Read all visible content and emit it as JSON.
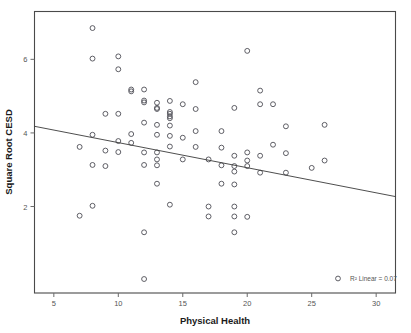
{
  "chart_data": {
    "type": "scatter",
    "title": "",
    "xlabel": "Physical Health",
    "ylabel": "Square Root CESD",
    "xlim": [
      3.5,
      31.5
    ],
    "ylim": [
      -0.35,
      7.3
    ],
    "xticks": [
      5,
      10,
      15,
      20,
      25,
      30
    ],
    "xtick_labels": [
      "5",
      "10",
      "15",
      "20",
      "25",
      "30"
    ],
    "yticks": [
      2,
      4,
      6
    ],
    "ytick_labels": [
      "2",
      "4",
      "6"
    ],
    "grid": false,
    "legend_position": "bottom-right",
    "annotation": "R² Linear = 0.07",
    "annotation_marker": "open-circle",
    "fit": {
      "type": "linear",
      "r_squared": 0.07,
      "x_start": 3.5,
      "y_start": 4.18,
      "x_end": 31.5,
      "y_end": 2.27
    },
    "marker": "open-circle",
    "points": [
      [
        8.0,
        6.85
      ],
      [
        8.0,
        6.02
      ],
      [
        10.0,
        6.08
      ],
      [
        10.0,
        5.73
      ],
      [
        20.0,
        6.23
      ],
      [
        16.0,
        5.38
      ],
      [
        11.0,
        5.18
      ],
      [
        11.0,
        5.13
      ],
      [
        12.0,
        5.18
      ],
      [
        21.0,
        5.15
      ],
      [
        12.0,
        4.88
      ],
      [
        12.0,
        4.83
      ],
      [
        13.0,
        4.82
      ],
      [
        14.0,
        4.87
      ],
      [
        15.0,
        4.78
      ],
      [
        21.0,
        4.78
      ],
      [
        22.0,
        4.78
      ],
      [
        13.0,
        4.68
      ],
      [
        13.0,
        4.65
      ],
      [
        16.0,
        4.65
      ],
      [
        19.0,
        4.68
      ],
      [
        9.0,
        4.52
      ],
      [
        10.0,
        4.52
      ],
      [
        14.0,
        4.57
      ],
      [
        14.0,
        4.52
      ],
      [
        14.0,
        4.45
      ],
      [
        14.0,
        4.4
      ],
      [
        12.0,
        4.28
      ],
      [
        13.0,
        4.22
      ],
      [
        14.0,
        4.2
      ],
      [
        23.0,
        4.18
      ],
      [
        26.0,
        4.22
      ],
      [
        16.0,
        4.05
      ],
      [
        18.0,
        4.05
      ],
      [
        8.0,
        3.95
      ],
      [
        11.0,
        3.97
      ],
      [
        13.0,
        3.95
      ],
      [
        14.0,
        3.92
      ],
      [
        15.0,
        3.87
      ],
      [
        10.0,
        3.78
      ],
      [
        11.0,
        3.73
      ],
      [
        22.0,
        3.68
      ],
      [
        7.0,
        3.62
      ],
      [
        14.0,
        3.63
      ],
      [
        16.0,
        3.62
      ],
      [
        18.0,
        3.6
      ],
      [
        9.0,
        3.52
      ],
      [
        10.0,
        3.48
      ],
      [
        12.0,
        3.47
      ],
      [
        13.0,
        3.47
      ],
      [
        20.0,
        3.47
      ],
      [
        23.0,
        3.45
      ],
      [
        19.0,
        3.38
      ],
      [
        21.0,
        3.38
      ],
      [
        13.0,
        3.28
      ],
      [
        15.0,
        3.28
      ],
      [
        17.0,
        3.28
      ],
      [
        20.0,
        3.25
      ],
      [
        26.0,
        3.25
      ],
      [
        8.0,
        3.13
      ],
      [
        9.0,
        3.1
      ],
      [
        12.0,
        3.13
      ],
      [
        13.0,
        3.12
      ],
      [
        18.0,
        3.12
      ],
      [
        19.0,
        3.1
      ],
      [
        20.0,
        3.1
      ],
      [
        25.0,
        3.05
      ],
      [
        19.0,
        2.95
      ],
      [
        21.0,
        2.92
      ],
      [
        23.0,
        2.92
      ],
      [
        13.0,
        2.62
      ],
      [
        18.0,
        2.62
      ],
      [
        19.0,
        2.6
      ],
      [
        14.0,
        2.05
      ],
      [
        8.0,
        2.02
      ],
      [
        17.0,
        2.0
      ],
      [
        19.0,
        2.0
      ],
      [
        7.0,
        1.75
      ],
      [
        17.0,
        1.73
      ],
      [
        19.0,
        1.73
      ],
      [
        20.0,
        1.72
      ],
      [
        12.0,
        1.3
      ],
      [
        19.0,
        1.3
      ],
      [
        12.0,
        0.03
      ]
    ]
  }
}
